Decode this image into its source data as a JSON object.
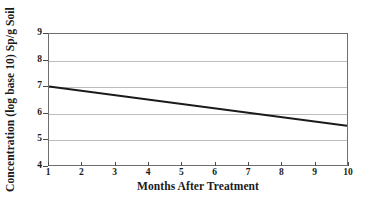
{
  "chart_data": {
    "type": "line",
    "title": "",
    "xlabel": "Months After Treatment",
    "ylabel": "Concentration (log base 10) Sp/g Soil",
    "x": [
      1,
      10
    ],
    "values": [
      7.0,
      5.5
    ],
    "series": [
      {
        "name": "Concentration",
        "x": [
          1,
          10
        ],
        "values": [
          7.0,
          5.5
        ],
        "color": "#1a1a1a"
      }
    ],
    "xlim": [
      1,
      10
    ],
    "ylim": [
      4,
      9
    ],
    "xticks": [
      "1",
      "2",
      "3",
      "4",
      "5",
      "6",
      "7",
      "8",
      "9",
      "10"
    ],
    "xtick_values": [
      1,
      2,
      3,
      4,
      5,
      6,
      7,
      8,
      9,
      10
    ],
    "yticks": [
      "9",
      "8",
      "7",
      "6",
      "5",
      "4"
    ],
    "ytick_values": [
      9,
      8,
      7,
      6,
      5,
      4
    ],
    "gridlines": {
      "horizontal": [
        8,
        7,
        6,
        5
      ],
      "vertical": [],
      "color": "#bcbcbc"
    },
    "legend": null,
    "legend_position": "none",
    "frame_color": "#6e6e6e",
    "background": "#ffffff",
    "annotations": []
  }
}
